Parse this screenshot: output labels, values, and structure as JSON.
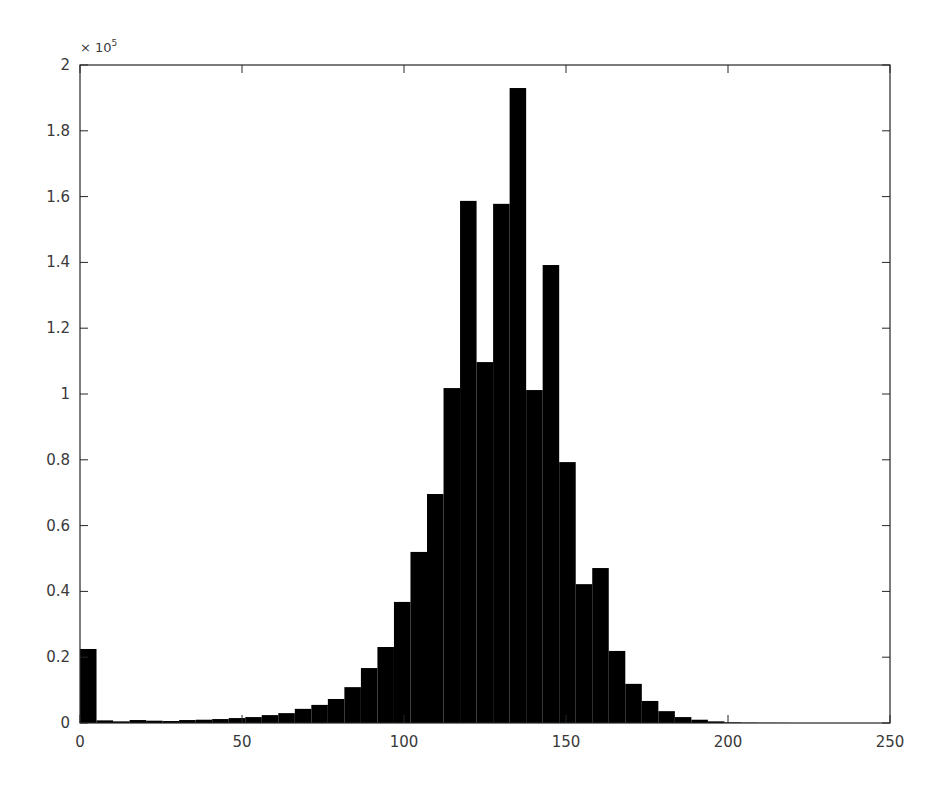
{
  "chart_data": {
    "type": "bar",
    "subtype": "histogram",
    "title": "",
    "xlabel": "",
    "ylabel": "",
    "xlim": [
      0,
      250
    ],
    "ylim": [
      0,
      200000
    ],
    "y_exponent_label": "× 10",
    "y_exponent_power": "5",
    "grid": false,
    "legend": null,
    "bar_color": "#000000",
    "bin_width": 5.1,
    "bin_start": 0,
    "x_ticks": [
      0,
      50,
      100,
      150,
      200,
      250
    ],
    "x_tick_labels": [
      "0",
      "50",
      "100",
      "150",
      "200",
      "250"
    ],
    "y_ticks": [
      0,
      0.2,
      0.4,
      0.6,
      0.8,
      1,
      1.2,
      1.4,
      1.6,
      1.8,
      2
    ],
    "y_tick_labels": [
      "0",
      "0.2",
      "0.4",
      "0.6",
      "0.8",
      "1",
      "1.2",
      "1.4",
      "1.6",
      "1.8",
      "2"
    ],
    "values": [
      22500,
      800,
      500,
      900,
      700,
      600,
      900,
      1000,
      1200,
      1500,
      1800,
      2400,
      3000,
      4300,
      5500,
      7300,
      10900,
      16700,
      23100,
      36800,
      52000,
      69600,
      101800,
      158700,
      109700,
      157800,
      193000,
      101200,
      139200,
      79300,
      42200,
      47100,
      21900,
      11900,
      6700,
      3600,
      1800,
      1000,
      500,
      200,
      100,
      50,
      30,
      0,
      0,
      0,
      0,
      0,
      0,
      0
    ]
  }
}
